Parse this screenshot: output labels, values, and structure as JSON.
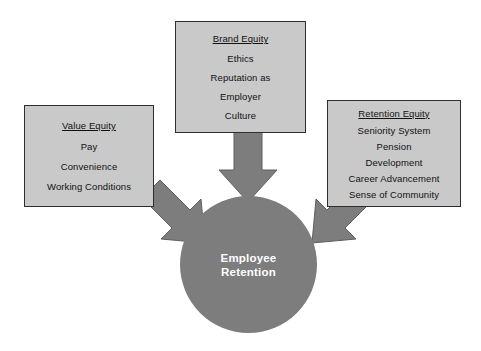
{
  "diagram": {
    "colors": {
      "box_fill": "#c9c9c9",
      "box_border": "#2e2e2e",
      "node_fill": "#7d7d7d",
      "arrow_fill": "#7d7d7d",
      "text": "#111111",
      "node_text": "#ffffff",
      "background": "#ffffff"
    },
    "center_node": {
      "label_line_1": "Employee",
      "label_line_2": "Retention"
    },
    "boxes": [
      {
        "id": "value-equity",
        "title": "Value Equity",
        "items": [
          "Pay",
          "Convenience",
          "Working Conditions"
        ]
      },
      {
        "id": "brand-equity",
        "title": "Brand Equity",
        "items": [
          "Ethics",
          "Reputation as",
          "Employer",
          "Culture"
        ]
      },
      {
        "id": "retention-equity",
        "title": "Retention Equity",
        "items": [
          "Seniority System",
          "Pension",
          "Development",
          "Career Advancement",
          "Sense of Community"
        ]
      }
    ],
    "arrows": [
      {
        "id": "arrow-brand-to-center",
        "direction": "down"
      },
      {
        "id": "arrow-value-to-center",
        "direction": "down-right"
      },
      {
        "id": "arrow-retention-to-center",
        "direction": "down-left"
      }
    ]
  }
}
